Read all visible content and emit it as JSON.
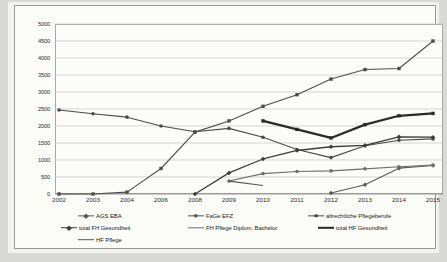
{
  "page": {
    "background_color": "#d9d9d5",
    "paper_color": "#f2f2ee",
    "frame_border_color": "#9a9a96"
  },
  "chart_data": {
    "type": "line",
    "title": "",
    "subtitle": "",
    "xlabel": "",
    "ylabel": "",
    "ylim": [
      0,
      5000
    ],
    "ytick_step": 500,
    "grid": true,
    "legend_position": "bottom",
    "categories": [
      "2002",
      "2003",
      "2004",
      "2006",
      "2008",
      "2009",
      "2010",
      "2011",
      "2012",
      "2013",
      "2014",
      "2015"
    ],
    "yticks": [
      "0",
      "500",
      "1000",
      "1500",
      "2000",
      "2500",
      "3000",
      "3500",
      "4000",
      "4500",
      "5000"
    ],
    "series": [
      {
        "name": "AGS EBA",
        "color": "#5a5a5a",
        "marker": "diamond",
        "line_width": 1.1,
        "values": [
          null,
          null,
          null,
          null,
          null,
          null,
          null,
          null,
          30,
          270,
          760,
          840
        ]
      },
      {
        "name": "FaGe EFZ",
        "color": "#4e4e4e",
        "marker": "square",
        "line_width": 1.1,
        "values": [
          0,
          0,
          55,
          750,
          1820,
          2150,
          2580,
          2920,
          3380,
          3660,
          3690,
          4500
        ]
      },
      {
        "name": "altrechtliche Pflegeberufe",
        "color": "#4a4a4a",
        "marker": "circle",
        "line_width": 1.1,
        "values": [
          2470,
          2360,
          2260,
          2000,
          1830,
          1930,
          1670,
          1310,
          1070,
          1420,
          1580,
          1620
        ]
      },
      {
        "name": "total FH Gesundheit",
        "color": "#3c3c3c",
        "marker": "diamond",
        "line_width": 1.3,
        "values": [
          null,
          null,
          null,
          null,
          0,
          620,
          1030,
          1280,
          1390,
          1430,
          1680,
          1670
        ]
      },
      {
        "name": "FH Pflege Diplom, Bachelor",
        "color": "#6e6e6e",
        "marker": "circle",
        "line_width": 1.1,
        "values": [
          null,
          null,
          null,
          null,
          null,
          380,
          600,
          660,
          680,
          740,
          800,
          850
        ]
      },
      {
        "name": "total  HF Gesundheit",
        "color": "#2a2a2a",
        "marker": "square",
        "line_width": 2.2,
        "values": [
          null,
          null,
          null,
          null,
          null,
          null,
          2150,
          1900,
          1650,
          2040,
          2300,
          2370
        ]
      },
      {
        "name": "HF Pflege",
        "color": "#555555",
        "marker": "none",
        "line_width": 1.1,
        "values": [
          null,
          null,
          null,
          null,
          null,
          380,
          250,
          null,
          null,
          null,
          null,
          null
        ]
      }
    ]
  },
  "legend": {
    "rows": [
      [
        {
          "label": "AGS EBA",
          "marker": "diamond",
          "color": "#5a5a5a",
          "thickness": 1.3
        },
        {
          "label": "FaGe EFZ",
          "marker": "square",
          "color": "#4e4e4e",
          "thickness": 1.3
        },
        {
          "label": "altrechtliche Pflegeberufe",
          "marker": "circle",
          "color": "#4a4a4a",
          "thickness": 1.3
        }
      ],
      [
        {
          "label": "total FH Gesundheit",
          "marker": "diamond",
          "color": "#3c3c3c",
          "thickness": 1.6
        },
        {
          "label": "FH Pflege Diplom, Bachelor",
          "marker": "none",
          "color": "#6e6e6e",
          "thickness": 1.4
        },
        {
          "label": "total  HF Gesundheit",
          "marker": "none",
          "color": "#2a2a2a",
          "thickness": 2.4
        }
      ],
      [
        {
          "label": "HF Pflege",
          "marker": "none",
          "color": "#555555",
          "thickness": 1.6
        }
      ]
    ]
  }
}
